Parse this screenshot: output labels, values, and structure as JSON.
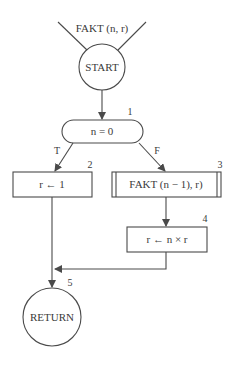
{
  "diagram": {
    "type": "flowchart",
    "entry_label": "FAKT (n, r)",
    "nodes": {
      "start": {
        "label": "START",
        "shape": "circle"
      },
      "decision": {
        "number": "1",
        "label": "n = 0",
        "shape": "rounded-pill"
      },
      "assign_one": {
        "number": "2",
        "label": "r ← 1",
        "shape": "rectangle"
      },
      "recursive_call": {
        "number": "3",
        "label": "FAKT (n − 1), r)",
        "shape": "predefined-process"
      },
      "multiply": {
        "number": "4",
        "label": "r ← n × r",
        "shape": "rectangle"
      },
      "return": {
        "number": "5",
        "label": "RETURN",
        "shape": "circle"
      }
    },
    "edges": {
      "true_label": "T",
      "false_label": "F"
    }
  }
}
